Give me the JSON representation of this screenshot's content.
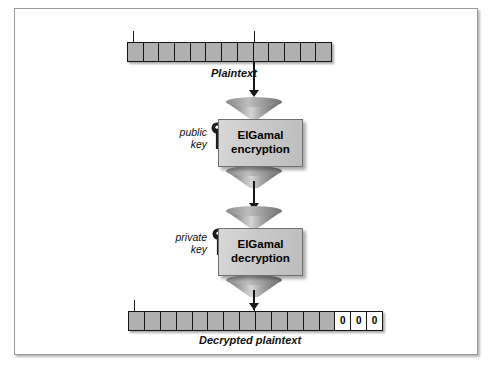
{
  "diagram": {
    "colors": {
      "cell_fill": "#b0b0b0",
      "cell_zero_fill": "#ffffff",
      "box_fill": "#c9c9c9",
      "stroke": "#141414",
      "frame": "#9a9a9a"
    }
  },
  "top_bar": {
    "name": "plaintext-bar",
    "cell_count": 13,
    "cells": [
      "",
      "",
      "",
      "",
      "",
      "",
      "",
      "",
      "",
      "",
      "",
      "",
      ""
    ],
    "caption": "Plaintext"
  },
  "bottom_bar": {
    "name": "decrypted-plaintext-bar",
    "cell_count": 16,
    "cells": [
      "",
      "",
      "",
      "",
      "",
      "",
      "",
      "",
      "",
      "",
      "",
      "",
      "",
      "0",
      "0",
      "0"
    ],
    "padding_values": [
      "0",
      "0",
      "0"
    ],
    "caption": "Decrypted plaintext"
  },
  "encryption": {
    "box_line1": "ElGamal",
    "box_line2": "encryption",
    "key_line1": "public",
    "key_line2": "key",
    "key_icon": "key-icon"
  },
  "decryption": {
    "box_line1": "ElGamal",
    "box_line2": "decryption",
    "key_line1": "private",
    "key_line2": "key",
    "key_icon": "key-icon"
  }
}
